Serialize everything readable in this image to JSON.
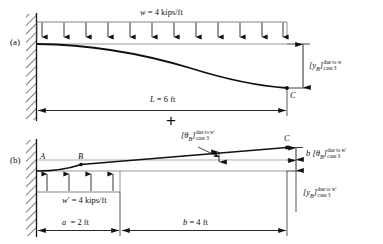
{
  "figure": {
    "panel_a": {
      "tag": "(a)",
      "load_label": "w = 4 kips/ft",
      "span_label": "L = 6 ft",
      "point_c": "C",
      "deflection": {
        "base": "[y",
        "subscript": "B",
        "close": "]",
        "sup": "due to w",
        "sub": "case 3"
      },
      "arrow_count": 12
    },
    "panel_b": {
      "tag": "(b)",
      "load_label": "w' = 4 kips/ft",
      "dim_a": "a  = 2 ft",
      "dim_b": "b = 4 ft",
      "point_a": "A",
      "point_b": "B",
      "point_c": "C",
      "slope_callout": {
        "base": "[θ",
        "subscript": "B",
        "close": "]",
        "sup": "due to w'",
        "sub": "case 3"
      },
      "moment_arm": {
        "prefix": "b",
        "base": "[θ",
        "subscript": "B",
        "close": "]",
        "sup": "due to w'",
        "sub": "case 3"
      },
      "deflection": {
        "base": "[y",
        "subscript": "B",
        "close": "]",
        "sup": "due to w'",
        "sub": "case 3"
      },
      "arrow_count": 4
    },
    "operator": "+",
    "colors": {
      "ink": "#111111",
      "rule": "#6b6b6b",
      "background": "#ffffff"
    }
  }
}
